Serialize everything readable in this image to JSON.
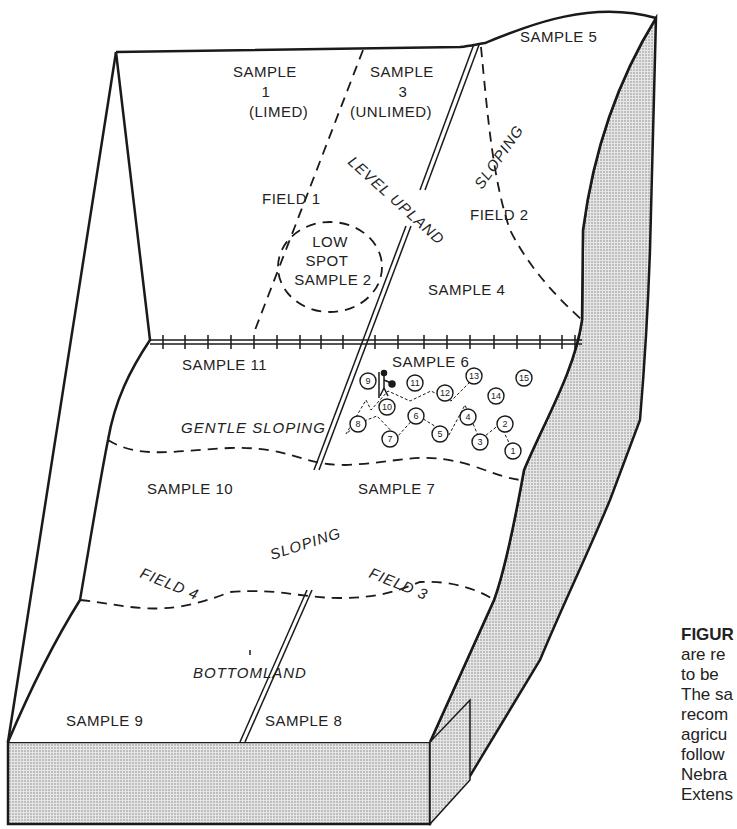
{
  "figure": {
    "caption_lines": [
      "FIGUR",
      "are re",
      "to be",
      "The sa",
      "recom",
      "agricu",
      "follow",
      "Nebra",
      "Extens"
    ]
  },
  "fields": {
    "field1": "FIELD 1",
    "field2": "FIELD 2",
    "field3": "FIELD 3",
    "field4": "FIELD 4"
  },
  "samples": {
    "s1": {
      "line1": "SAMPLE",
      "line2": "1",
      "line3": "(LIMED)"
    },
    "s3": {
      "line1": "SAMPLE",
      "line2": "3",
      "line3": "(UNLIMED)"
    },
    "s2": {
      "line1": "LOW",
      "line2": "SPOT",
      "line3": "SAMPLE 2"
    },
    "s4": "SAMPLE 4",
    "s5": "SAMPLE 5",
    "s6": "SAMPLE  6",
    "s7": "SAMPLE 7",
    "s8": "SAMPLE 8",
    "s9": "SAMPLE 9",
    "s10": "SAMPLE 10",
    "s11": "SAMPLE 11"
  },
  "terrain": {
    "level_upland": "LEVEL UPLAND",
    "sloping_top": "SLOPING",
    "gentle_sloping": "GENTLE SLOPING",
    "sloping_mid": "SLOPING",
    "bottomland": "BOTTOMLAND"
  },
  "sampling_points": [
    "1",
    "2",
    "3",
    "4",
    "5",
    "6",
    "7",
    "8",
    "9",
    "10",
    "11",
    "12",
    "13",
    "14",
    "15"
  ],
  "colors": {
    "line": "#1a1a1a",
    "shade": "#bdbdbd",
    "background": "#ffffff"
  }
}
